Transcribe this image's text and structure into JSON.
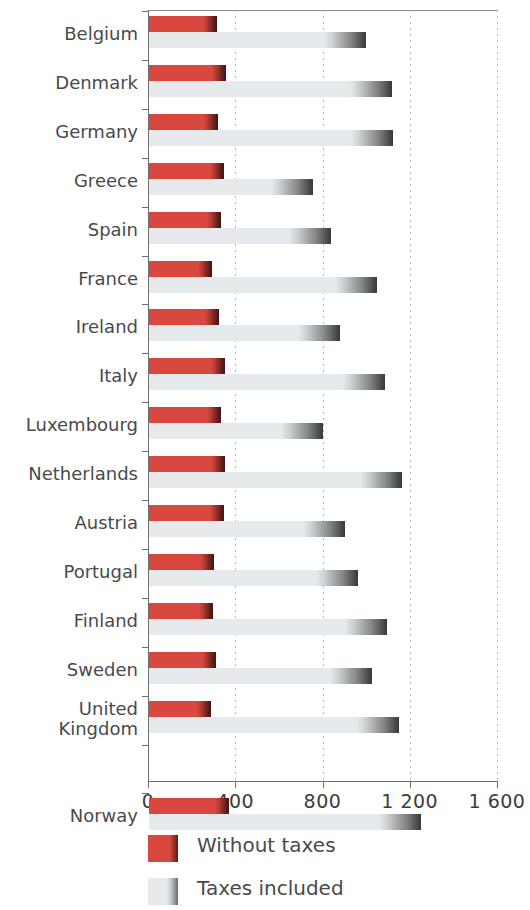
{
  "chart_data": {
    "type": "bar",
    "orientation": "horizontal",
    "title": "",
    "subtitle": "",
    "xlabel": "",
    "ylabel": "",
    "xlim": [
      0,
      1600
    ],
    "grid": true,
    "gridlines": [
      400,
      800,
      1200,
      1600
    ],
    "xticks": [
      0,
      400,
      800,
      1200,
      1600
    ],
    "xtick_labels": [
      "0",
      "400",
      "800",
      "1 200",
      "1 600"
    ],
    "legend_position": "bottom-left",
    "categories": [
      "Belgium",
      "Denmark",
      "Germany",
      "Greece",
      "Spain",
      "France",
      "Ireland",
      "Italy",
      "Luxembourg",
      "Netherlands",
      "Austria",
      "Portugal",
      "Finland",
      "Sweden",
      "United\nKingdom",
      "",
      "Norway"
    ],
    "series": [
      {
        "name": "Without taxes",
        "color": "#d9483f",
        "values": [
          315,
          358,
          323,
          350,
          335,
          292,
          327,
          353,
          335,
          353,
          350,
          303,
          299,
          312,
          288,
          null,
          373
        ]
      },
      {
        "name": "Taxes included",
        "color": "#e6eaec",
        "values": [
          1000,
          1118,
          1122,
          758,
          840,
          1051,
          878,
          1087,
          801,
          1163,
          904,
          965,
          1097,
          1029,
          1152,
          null,
          1252
        ]
      }
    ]
  },
  "legend": {
    "items": [
      {
        "label": "Without taxes",
        "swatch": "red"
      },
      {
        "label": "Taxes included",
        "swatch": "gray"
      }
    ]
  },
  "colors": {
    "accent_red": "#d9483f",
    "bar_gray": "#e6eaec",
    "axis": "#6f6f6f",
    "grid": "#b9b9b9",
    "text": "#4a4a4a"
  }
}
